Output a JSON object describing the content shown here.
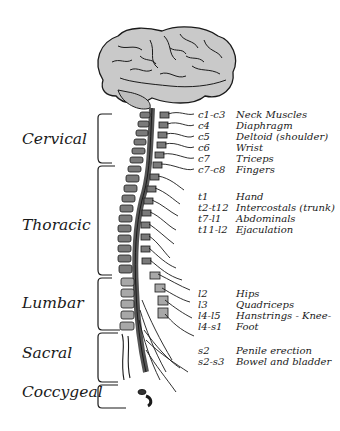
{
  "diagram": {
    "type": "spinal-nerve-map",
    "regions": [
      {
        "name": "Cervical",
        "y": 140
      },
      {
        "name": "Thoracic",
        "y": 228
      },
      {
        "name": "Lumbar",
        "y": 305
      },
      {
        "name": "Sacral",
        "y": 355
      },
      {
        "name": "Coccygeal",
        "y": 394
      }
    ],
    "labels": [
      {
        "segment": "c1-c3",
        "function": "Neck Muscles",
        "y": 114
      },
      {
        "segment": "c4",
        "function": "Diaphragm",
        "y": 125
      },
      {
        "segment": "c5",
        "function": "Deltoid (shoulder)",
        "y": 136
      },
      {
        "segment": "c6",
        "function": "Wrist",
        "y": 147
      },
      {
        "segment": "c7",
        "function": "Triceps",
        "y": 158
      },
      {
        "segment": "c7-c8",
        "function": "Fingers",
        "y": 169
      },
      {
        "segment": "t1",
        "function": "Hand",
        "y": 195
      },
      {
        "segment": "t2-t12",
        "function": "Intercostals (trunk)",
        "y": 206
      },
      {
        "segment": "t7-l1",
        "function": "Abdominals",
        "y": 217
      },
      {
        "segment": "t11-l2",
        "function": "Ejaculation",
        "y": 228
      },
      {
        "segment": "l2",
        "function": "Hips",
        "y": 290
      },
      {
        "segment": "l3",
        "function": "Quadriceps",
        "y": 301
      },
      {
        "segment": "l4-l5",
        "function": "Hanstrings - Knee-",
        "y": 312
      },
      {
        "segment": "l4-s1",
        "function": "Foot",
        "y": 323
      },
      {
        "segment": "s2",
        "function": "Penile erection",
        "y": 347
      },
      {
        "segment": "s2-s3",
        "function": "Bowel and bladder",
        "y": 358
      }
    ],
    "colors": {
      "brain_fill": "#c9c9c9",
      "vertebra_fill": "#7a7a7a",
      "lumbar_fill": "#a8a8a8",
      "cord": "#555555",
      "outline": "#1a1a1a"
    }
  }
}
